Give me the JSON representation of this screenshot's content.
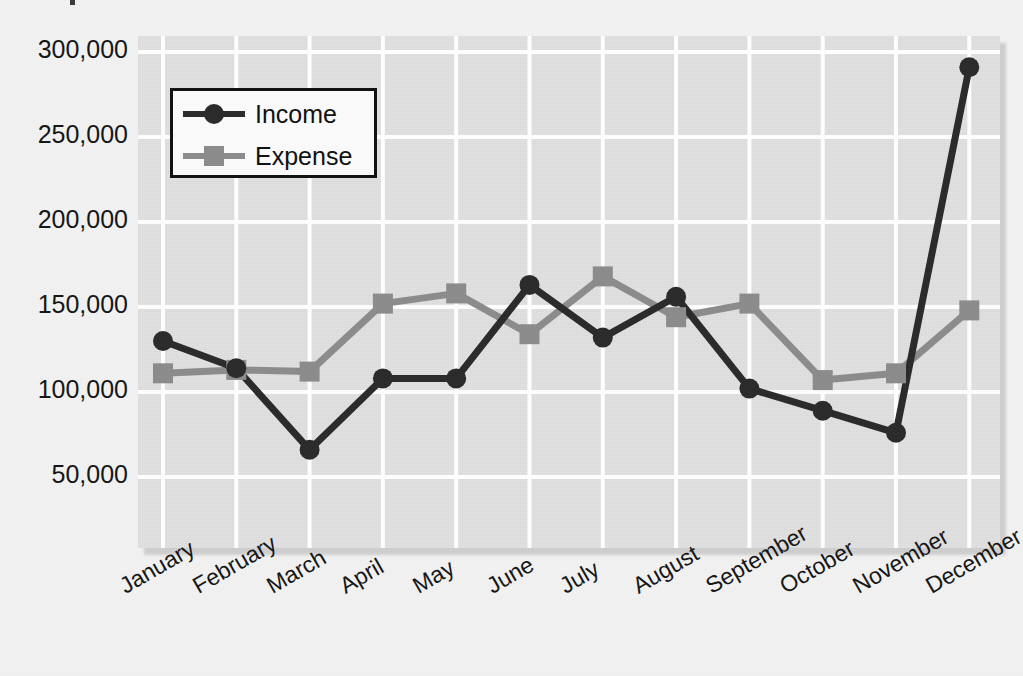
{
  "chart_data": {
    "type": "line",
    "title": "",
    "xlabel": "",
    "ylabel": "",
    "categories": [
      "January",
      "February",
      "March",
      "April",
      "May",
      "June",
      "July",
      "August",
      "September",
      "October",
      "November",
      "December"
    ],
    "series": [
      {
        "name": "Income",
        "color": "#2b2b2b",
        "marker": "circle",
        "values": [
          130000,
          114000,
          66000,
          108000,
          108000,
          163000,
          132000,
          156000,
          102000,
          89000,
          76000,
          291000
        ]
      },
      {
        "name": "Expense",
        "color": "#8c8c8c",
        "marker": "square",
        "values": [
          111000,
          113000,
          112000,
          152000,
          158000,
          134000,
          168000,
          144000,
          152000,
          107000,
          111000,
          148000
        ]
      }
    ],
    "ylim": [
      25000,
      310000
    ],
    "yticks": [
      50000,
      100000,
      150000,
      200000,
      250000,
      300000
    ],
    "ytick_labels": [
      "50,000",
      "100,000",
      "150,000",
      "200,000",
      "250,000",
      "300,000"
    ],
    "grid": true,
    "grid_color": "#ffffff",
    "plot_background": "#e2e2e2",
    "legend_position": "upper-left",
    "legend_entries": [
      "Income",
      "Expense"
    ]
  },
  "legend": {
    "items": [
      {
        "label": "Income"
      },
      {
        "label": "Expense"
      }
    ]
  }
}
